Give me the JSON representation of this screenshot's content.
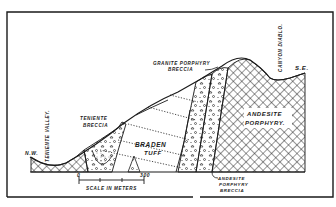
{
  "diagram": {
    "type": "geological-cross-section",
    "orientation": {
      "left": "N.W.",
      "right": "S.E."
    },
    "labels": {
      "nw": "N.W.",
      "se": "S.E.",
      "teniente_valley": "TENIENTE VALLEY.",
      "canyon_diablo": "CANYON DIABLO.",
      "teniente_breccia_line1": "TENIENTE",
      "teniente_breccia_line2": "BRECCIA",
      "granite_breccia_line1": "GRANITE PORPHYRY",
      "granite_breccia_line2": "BRECCIA",
      "braden_line1": "BRADEN",
      "braden_line2": "TUFF",
      "andesite_line1": "ANDESITE",
      "andesite_line2": "PORPHYRY.",
      "andesite_breccia_line1": "ANDESITE",
      "andesite_breccia_line2": "PORPHYRY",
      "andesite_breccia_line3": "BRECCIA"
    },
    "scale": {
      "start": "0",
      "end": "300",
      "caption": "SCALE IN METERS"
    },
    "units": [
      "Braden Tuff",
      "Andesite Porphyry",
      "Andesite Porphyry Breccia",
      "Granite Porphyry Breccia",
      "Teniente Breccia"
    ],
    "colors": {
      "ink": "#1a1a1a",
      "paper": "#ffffff"
    }
  }
}
